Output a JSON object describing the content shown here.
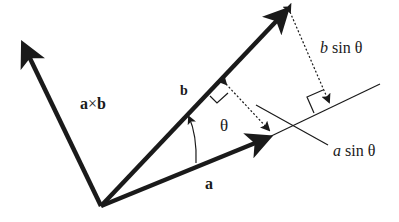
{
  "diagram": {
    "colors": {
      "stroke": "#1a1a1a",
      "background": "#ffffff"
    },
    "vectors": [
      {
        "name": "a",
        "from": [
          101,
          206
        ],
        "to": [
          270,
          137
        ]
      },
      {
        "name": "b",
        "from": [
          101,
          206
        ],
        "to": [
          288,
          9
        ]
      },
      {
        "name": "a x b",
        "from": [
          101,
          206
        ],
        "to": [
          22,
          42
        ]
      }
    ],
    "labels": {
      "cross": {
        "a": "a",
        "times": "×",
        "b": "b"
      },
      "b": "b",
      "theta": "θ",
      "a": "a",
      "b_sin_theta": {
        "var": "b",
        "func": " sin ",
        "angle": "θ"
      },
      "a_sin_theta": {
        "var": "a",
        "func": " sin ",
        "angle": "θ"
      }
    }
  }
}
